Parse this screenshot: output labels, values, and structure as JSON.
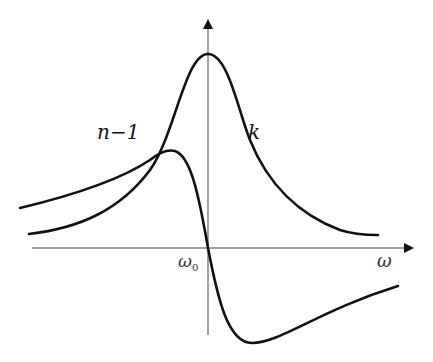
{
  "diagram": {
    "type": "resonance curves (absorption and dispersion)",
    "axes": {
      "x_label": "ω",
      "x_tick_label": "ω",
      "x_tick_sub": "0",
      "y_axis": "vertical arrow at ω0, unlabeled"
    },
    "curves": [
      {
        "id": "k",
        "label": "k",
        "shape": "Lorentzian absorption peak centered at ω0"
      },
      {
        "id": "n-1",
        "label": "n−1",
        "shape": "dispersion curve: maximum left of ω0, zero at ω0, minimum right of ω0"
      }
    ],
    "colors": {
      "line": "#111111",
      "axis": "#444444",
      "background": "#ffffff"
    }
  }
}
